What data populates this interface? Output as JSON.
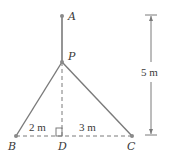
{
  "diagram": {
    "colors": {
      "line": "#7a7a7a",
      "text": "#3a3a3a",
      "point": "#8a8a8a"
    },
    "points": {
      "A": {
        "label": "A",
        "x": 62,
        "y": 16
      },
      "P": {
        "label": "P",
        "x": 62,
        "y": 62
      },
      "B": {
        "label": "B",
        "x": 16,
        "y": 136
      },
      "D": {
        "label": "D",
        "x": 62,
        "y": 136
      },
      "C": {
        "label": "C",
        "x": 132,
        "y": 136
      }
    },
    "dimensions": {
      "BD": "2 m",
      "DC": "3 m",
      "height": "5 m"
    }
  }
}
